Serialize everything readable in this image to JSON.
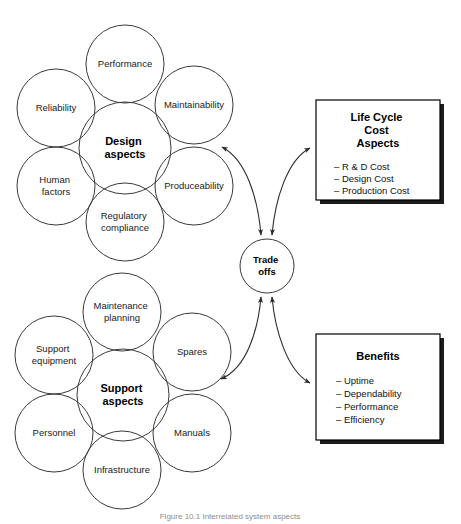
{
  "figure": {
    "caption": "Figure 10.1 Interrelated system aspects"
  },
  "hub": {
    "name": "trade-offs-hub",
    "line1": "Trade",
    "line2": "offs",
    "cx": 267,
    "cy": 266,
    "r": 27
  },
  "clusters": [
    {
      "id": "design",
      "center_label_line1": "Design",
      "center_label_line2": "aspects",
      "center": {
        "cx": 125,
        "cy": 148,
        "r": 46
      },
      "satellites": [
        {
          "name": "performance",
          "label": [
            "Performance"
          ],
          "cx": 125,
          "cy": 64,
          "r": 39
        },
        {
          "name": "maintainability",
          "label": [
            "Maintainability"
          ],
          "cx": 194,
          "cy": 105,
          "r": 39
        },
        {
          "name": "produceability",
          "label": [
            "Produceability"
          ],
          "cx": 194,
          "cy": 186,
          "r": 39
        },
        {
          "name": "regulatory-compliance",
          "label": [
            "Regulatory",
            "compliance"
          ],
          "cx": 125,
          "cy": 222,
          "r": 39
        },
        {
          "name": "human-factors",
          "label": [
            "Human",
            "factors"
          ],
          "cx": 56,
          "cy": 186,
          "r": 39
        },
        {
          "name": "reliability",
          "label": [
            "Reliability"
          ],
          "cx": 56,
          "cy": 108,
          "r": 39
        }
      ]
    },
    {
      "id": "support",
      "center_label_line1": "Support",
      "center_label_line2": "aspects",
      "center": {
        "cx": 123,
        "cy": 395,
        "r": 46
      },
      "satellites": [
        {
          "name": "maintenance-planning",
          "label": [
            "Maintenance",
            "planning"
          ],
          "cx": 122,
          "cy": 312,
          "r": 39
        },
        {
          "name": "spares",
          "label": [
            "Spares"
          ],
          "cx": 192,
          "cy": 352,
          "r": 39
        },
        {
          "name": "manuals",
          "label": [
            "Manuals"
          ],
          "cx": 192,
          "cy": 433,
          "r": 39
        },
        {
          "name": "infrastructure",
          "label": [
            "Infrastructure"
          ],
          "cx": 122,
          "cy": 470,
          "r": 39
        },
        {
          "name": "personnel",
          "label": [
            "Personnel"
          ],
          "cx": 54,
          "cy": 433,
          "r": 39
        },
        {
          "name": "support-equipment",
          "label": [
            "Support",
            "equipment"
          ],
          "cx": 54,
          "cy": 355,
          "r": 39
        }
      ]
    }
  ],
  "panels": [
    {
      "id": "life-cycle-cost-aspects",
      "title": [
        "Life Cycle",
        "Cost",
        "Aspects"
      ],
      "items": [
        "– R & D Cost",
        "– Design Cost",
        "– Production Cost"
      ],
      "x": 316,
      "y": 100,
      "w": 124,
      "h": 100
    },
    {
      "id": "benefits",
      "title": [
        "Benefits"
      ],
      "items": [
        "– Uptime",
        "– Dependability",
        "– Performance",
        "– Efficiency"
      ],
      "x": 316,
      "y": 334,
      "w": 124,
      "h": 106
    }
  ],
  "connectors": [
    {
      "name": "connector-design-to-tradeoffs",
      "from": "design-cluster",
      "to": "trade-offs-hub",
      "double_headed": true
    },
    {
      "name": "connector-tradeoffs-to-lcc",
      "from": "trade-offs-hub",
      "to": "life-cycle-cost-aspects",
      "double_headed": true
    },
    {
      "name": "connector-support-to-tradeoffs",
      "from": "support-cluster",
      "to": "trade-offs-hub",
      "double_headed": true
    },
    {
      "name": "connector-tradeoffs-to-benefits",
      "from": "trade-offs-hub",
      "to": "benefits",
      "double_headed": true
    }
  ],
  "colors": {
    "stroke": "#3a3a3a",
    "panel_border": "#000000",
    "panel_shadow": "#1c1c1c",
    "text": "#1a1a1a",
    "caption": "#8d8d8d",
    "background": "#ffffff"
  }
}
